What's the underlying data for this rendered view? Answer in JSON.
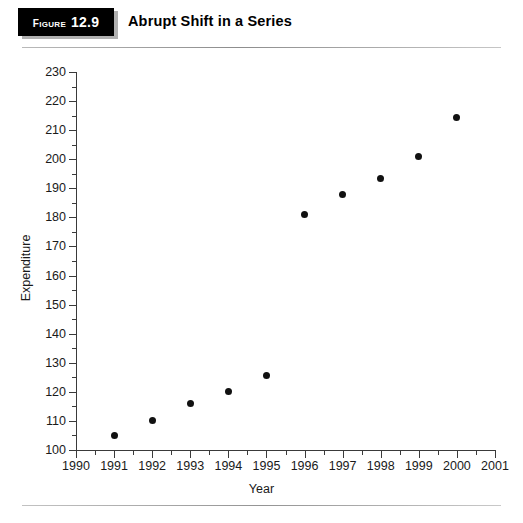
{
  "header": {
    "figure_word": "Figure",
    "figure_number": "12.9",
    "title": "Abrupt Shift in a Series"
  },
  "chart_data": {
    "type": "scatter",
    "title": "Abrupt Shift in a Series",
    "xlabel": "Year",
    "ylabel": "Expenditure",
    "xlim": [
      1990,
      2001
    ],
    "ylim": [
      100,
      230
    ],
    "xticks": [
      1990,
      1991,
      1992,
      1993,
      1994,
      1995,
      1996,
      1997,
      1998,
      1999,
      2000,
      2001
    ],
    "xtick_labels": [
      "1990",
      "1991",
      "1992",
      "1993",
      "1994",
      "1995",
      "1996",
      "1997",
      "1998",
      "1999",
      "2000",
      "2001"
    ],
    "x_minor_tick_step": 0.5,
    "yticks": [
      100,
      110,
      120,
      130,
      140,
      150,
      160,
      170,
      180,
      190,
      200,
      210,
      220,
      230
    ],
    "ytick_labels": [
      "100",
      "110",
      "120",
      "130",
      "140",
      "150",
      "160",
      "170",
      "180",
      "190",
      "200",
      "210",
      "220",
      "230"
    ],
    "y_minor_tick_step": 5,
    "grid": false,
    "legend": "none",
    "marker": "filled-circle",
    "marker_color": "#111111",
    "x": [
      1991,
      1992,
      1993,
      1994,
      1995,
      1996,
      1997,
      1998,
      1999,
      2000
    ],
    "values": [
      105,
      110,
      116,
      120,
      125.5,
      181,
      188,
      193.5,
      201,
      214.5
    ],
    "points": [
      {
        "year": 1991,
        "expenditure": 105
      },
      {
        "year": 1992,
        "expenditure": 110
      },
      {
        "year": 1993,
        "expenditure": 116
      },
      {
        "year": 1994,
        "expenditure": 120
      },
      {
        "year": 1995,
        "expenditure": 125.5
      },
      {
        "year": 1996,
        "expenditure": 181
      },
      {
        "year": 1997,
        "expenditure": 188
      },
      {
        "year": 1998,
        "expenditure": 193.5
      },
      {
        "year": 1999,
        "expenditure": 201
      },
      {
        "year": 2000,
        "expenditure": 214.5
      }
    ]
  }
}
